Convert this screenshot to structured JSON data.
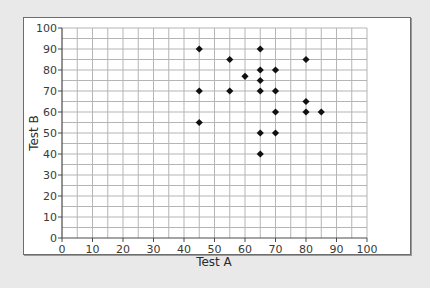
{
  "chart_data": {
    "type": "scatter",
    "title": "",
    "xlabel": "Test A",
    "ylabel": "Test B",
    "xlim": [
      0,
      100
    ],
    "ylim": [
      0,
      100
    ],
    "x_ticks": [
      0,
      10,
      20,
      30,
      40,
      50,
      60,
      70,
      80,
      90,
      100
    ],
    "y_ticks": [
      0,
      10,
      20,
      30,
      40,
      50,
      60,
      70,
      80,
      90,
      100
    ],
    "x_tick_labels": [
      "0",
      "10",
      "20",
      "30",
      "40",
      "50",
      "60",
      "70",
      "80",
      "90",
      "100"
    ],
    "y_tick_labels": [
      "0",
      "10",
      "20",
      "30",
      "40",
      "50",
      "60",
      "70",
      "80",
      "90",
      "100"
    ],
    "minor_grid_step": 5,
    "grid": true,
    "legend": null,
    "marker": "diamond",
    "marker_color": "#111111",
    "points": [
      {
        "x": 45,
        "y": 90
      },
      {
        "x": 45,
        "y": 70
      },
      {
        "x": 45,
        "y": 55
      },
      {
        "x": 55,
        "y": 85
      },
      {
        "x": 55,
        "y": 70
      },
      {
        "x": 60,
        "y": 77
      },
      {
        "x": 65,
        "y": 90
      },
      {
        "x": 65,
        "y": 80
      },
      {
        "x": 65,
        "y": 75
      },
      {
        "x": 65,
        "y": 70
      },
      {
        "x": 65,
        "y": 50
      },
      {
        "x": 65,
        "y": 40
      },
      {
        "x": 70,
        "y": 80
      },
      {
        "x": 70,
        "y": 70
      },
      {
        "x": 70,
        "y": 60
      },
      {
        "x": 70,
        "y": 50
      },
      {
        "x": 80,
        "y": 85
      },
      {
        "x": 80,
        "y": 65
      },
      {
        "x": 80,
        "y": 60
      },
      {
        "x": 85,
        "y": 60
      }
    ]
  },
  "colors": {
    "grid": "#b5b5b5",
    "axis": "#4a4a4a",
    "background": "#ffffff",
    "page": "#e9e9e9"
  }
}
